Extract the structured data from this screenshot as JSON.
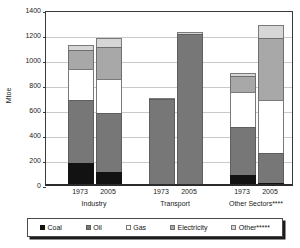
{
  "chart_data": {
    "type": "bar",
    "subtype": "stacked",
    "title": "",
    "xlabel": "",
    "ylabel": "Mtoe",
    "ylim": [
      0,
      1400
    ],
    "ytick_step": 200,
    "yticks": [
      0,
      200,
      400,
      600,
      800,
      1000,
      1200,
      1400
    ],
    "ytick_labels": [
      "0",
      "200",
      "400",
      "600",
      "800",
      "1000",
      "1200",
      "1400"
    ],
    "grid": true,
    "grid_axis": "y",
    "legend_position": "bottom",
    "categories": [
      "1973",
      "2005",
      "1973",
      "2005",
      "1973",
      "2005"
    ],
    "groups": [
      {
        "label": "Industry",
        "years": [
          "1973",
          "2005"
        ]
      },
      {
        "label": "Transport",
        "years": [
          "1973",
          "2005"
        ]
      },
      {
        "label": "Other Sectors****",
        "years": [
          "1973",
          "2005"
        ]
      }
    ],
    "series": [
      {
        "name": "Coal",
        "color": "#121212",
        "values": [
          165,
          100,
          0,
          0,
          75,
          10
        ]
      },
      {
        "name": "Oil",
        "color": "#777777",
        "values": [
          510,
          465,
          680,
          1200,
          380,
          240
        ]
      },
      {
        "name": "Gas",
        "color": "#ffffff",
        "values": [
          245,
          275,
          0,
          0,
          280,
          425
        ]
      },
      {
        "name": "Electricity",
        "color": "#a8a8a8",
        "values": [
          150,
          255,
          0,
          0,
          130,
          495
        ]
      },
      {
        "name": "Other*****",
        "color": "#d6d6d6",
        "values": [
          40,
          75,
          10,
          15,
          25,
          105
        ]
      }
    ],
    "totals": [
      1110,
      1170,
      690,
      1215,
      890,
      1275
    ],
    "bars": [
      {
        "group": "Industry",
        "year": "1973",
        "total": 1110,
        "segments": [
          {
            "name": "Coal",
            "value": 165
          },
          {
            "name": "Oil",
            "value": 510
          },
          {
            "name": "Gas",
            "value": 245
          },
          {
            "name": "Electricity",
            "value": 150
          },
          {
            "name": "Other*****",
            "value": 40
          }
        ]
      },
      {
        "group": "Industry",
        "year": "2005",
        "total": 1170,
        "segments": [
          {
            "name": "Coal",
            "value": 100
          },
          {
            "name": "Oil",
            "value": 465
          },
          {
            "name": "Gas",
            "value": 275
          },
          {
            "name": "Electricity",
            "value": 255
          },
          {
            "name": "Other*****",
            "value": 75
          }
        ]
      },
      {
        "group": "Transport",
        "year": "1973",
        "total": 690,
        "segments": [
          {
            "name": "Coal",
            "value": 0
          },
          {
            "name": "Oil",
            "value": 680
          },
          {
            "name": "Gas",
            "value": 0
          },
          {
            "name": "Electricity",
            "value": 0
          },
          {
            "name": "Other*****",
            "value": 10
          }
        ]
      },
      {
        "group": "Transport",
        "year": "2005",
        "total": 1215,
        "segments": [
          {
            "name": "Coal",
            "value": 0
          },
          {
            "name": "Oil",
            "value": 1200
          },
          {
            "name": "Gas",
            "value": 0
          },
          {
            "name": "Electricity",
            "value": 0
          },
          {
            "name": "Other*****",
            "value": 15
          }
        ]
      },
      {
        "group": "Other Sectors****",
        "year": "1973",
        "total": 890,
        "segments": [
          {
            "name": "Coal",
            "value": 75
          },
          {
            "name": "Oil",
            "value": 380
          },
          {
            "name": "Gas",
            "value": 280
          },
          {
            "name": "Electricity",
            "value": 130
          },
          {
            "name": "Other*****",
            "value": 25
          }
        ]
      },
      {
        "group": "Other Sectors****",
        "year": "2005",
        "total": 1275,
        "segments": [
          {
            "name": "Coal",
            "value": 10
          },
          {
            "name": "Oil",
            "value": 240
          },
          {
            "name": "Gas",
            "value": 425
          },
          {
            "name": "Electricity",
            "value": 495
          },
          {
            "name": "Other*****",
            "value": 105
          }
        ]
      }
    ],
    "legend": [
      {
        "label": "Coal",
        "color": "#121212",
        "swatch_class": "sw-coal"
      },
      {
        "label": "Oil",
        "color": "#777777",
        "swatch_class": "sw-oil"
      },
      {
        "label": "Gas",
        "color": "#ffffff",
        "swatch_class": "sw-gas"
      },
      {
        "label": "Electricity",
        "color": "#a8a8a8",
        "swatch_class": "sw-electricity"
      },
      {
        "label": "Other*****",
        "color": "#d6d6d6",
        "swatch_class": "sw-other"
      }
    ]
  }
}
